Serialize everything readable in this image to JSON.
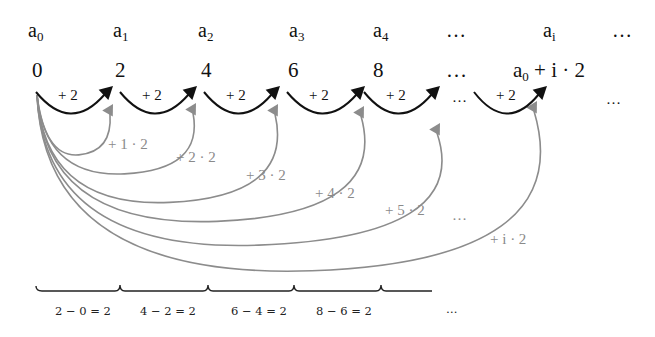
{
  "diagram": {
    "title": "",
    "terms": [
      {
        "base": "a",
        "sub": "0",
        "x": 28
      },
      {
        "base": "a",
        "sub": "1",
        "x": 113
      },
      {
        "base": "a",
        "sub": "2",
        "x": 198
      },
      {
        "base": "a",
        "sub": "3",
        "x": 289
      },
      {
        "base": "a",
        "sub": "4",
        "x": 373
      },
      {
        "base": "…",
        "sub": "",
        "x": 446
      },
      {
        "base": "a",
        "sub": "i",
        "x": 543
      },
      {
        "base": "…",
        "sub": "",
        "x": 612
      }
    ],
    "values": [
      {
        "text": "0",
        "x": 32
      },
      {
        "text": "2",
        "x": 115
      },
      {
        "text": "4",
        "x": 201
      },
      {
        "text": "6",
        "x": 288
      },
      {
        "text": "8",
        "x": 373
      },
      {
        "text": "…",
        "x": 446
      },
      {
        "text_prefix": "a",
        "text_sub": "0",
        "text_suffix": " + i · 2",
        "x": 513
      },
      {
        "text": "",
        "x": 0
      }
    ],
    "step_arcs": [
      {
        "label": "+ 2",
        "x0": 36,
        "x1": 113
      },
      {
        "label": "+ 2",
        "x0": 120,
        "x1": 197
      },
      {
        "label": "+ 2",
        "x0": 204,
        "x1": 280
      },
      {
        "label": "+ 2",
        "x0": 287,
        "x1": 365
      },
      {
        "label": "+ 2",
        "x0": 364,
        "x1": 440
      },
      {
        "label": "+ 2",
        "x0": 474,
        "x1": 547
      }
    ],
    "step_ellipses": [
      {
        "text": "…",
        "x": 452,
        "y": 90
      },
      {
        "text": "…",
        "x": 606,
        "y": 92
      }
    ],
    "cumulative_arcs": [
      {
        "label": "+ 1 · 2",
        "lx": 108,
        "ly": 137,
        "tx": 113,
        "ty": 104,
        "depth": 158
      },
      {
        "label": "+ 2 · 2",
        "lx": 176,
        "ly": 150,
        "tx": 196,
        "ty": 103,
        "depth": 178
      },
      {
        "label": "+ 3 · 2",
        "lx": 246,
        "ly": 168,
        "tx": 278,
        "ty": 104,
        "depth": 208
      },
      {
        "label": "+ 4 · 2",
        "lx": 315,
        "ly": 186,
        "tx": 364,
        "ty": 106,
        "depth": 228
      },
      {
        "label": "+ 5 · 2",
        "lx": 385,
        "ly": 203,
        "tx": 440,
        "ty": 123,
        "depth": 253
      },
      {
        "label": "+ i · 2",
        "lx": 490,
        "ly": 232,
        "tx": 537,
        "ty": 101,
        "depth": 280
      }
    ],
    "cumulative_ellipsis": {
      "text": "…",
      "x": 452,
      "y": 208
    },
    "differences": [
      {
        "label": "2 − 0 = 2",
        "x": 55
      },
      {
        "label": "4 − 2 = 2",
        "x": 140
      },
      {
        "label": "6 − 4 = 2",
        "x": 231
      },
      {
        "label": "8 − 6 = 2",
        "x": 316
      }
    ],
    "differences_ellipsis": {
      "text": "…",
      "x": 446
    },
    "colors": {
      "step_arc": "#111111",
      "cumulative_arc": "#8c8c8c",
      "brace": "#222222"
    }
  }
}
